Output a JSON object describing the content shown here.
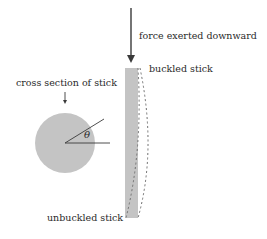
{
  "diagram": {
    "labels": {
      "force": "force exerted downward",
      "buckled": "buckled stick",
      "cross_section": "cross section of stick",
      "unbuckled": "unbuckled stick",
      "angle": "θ"
    },
    "colors": {
      "stick_fill": "#c4c4c4",
      "circle_fill": "#c4c4c4",
      "line": "#3a3a3a",
      "dashed": "#707070",
      "text": "#2a2a2a"
    },
    "icons": {
      "force_arrow": "down-arrow",
      "pointer_arrow": "small-down-arrow"
    }
  }
}
